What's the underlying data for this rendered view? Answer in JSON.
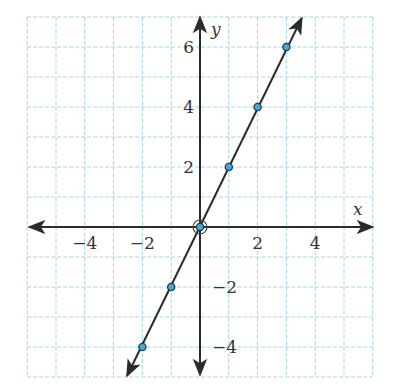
{
  "chart_data": {
    "type": "line",
    "title": "",
    "xlabel": "x",
    "ylabel": "y",
    "xlim": [
      -6,
      6
    ],
    "ylim": [
      -5,
      7
    ],
    "grid": true,
    "grid_style": "dashed",
    "x_ticks": [
      -4,
      -2,
      2,
      4
    ],
    "y_ticks": [
      -4,
      -2,
      2,
      4,
      6
    ],
    "x_tick_labels": [
      "−4",
      "−2",
      "2",
      "4"
    ],
    "y_tick_labels": [
      "−4",
      "−2",
      "2",
      "4",
      "6"
    ],
    "series": [
      {
        "name": "y = 2x",
        "equation": "y = 2x",
        "points": [
          [
            -2,
            -4
          ],
          [
            -1,
            -2
          ],
          [
            0,
            0
          ],
          [
            1,
            2
          ],
          [
            2,
            4
          ],
          [
            3,
            6
          ]
        ],
        "x": [
          -2,
          -1,
          0,
          1,
          2,
          3
        ],
        "values": [
          -4,
          -2,
          0,
          2,
          4,
          6
        ]
      }
    ],
    "highlighted_point": [
      0,
      0
    ]
  },
  "colors": {
    "grid": "#9fd8e6",
    "axis": "#2b2b2b",
    "line": "#2b2b2b",
    "point_fill": "#4aa6d6",
    "point_stroke": "#1f3d52",
    "text": "#333333"
  }
}
